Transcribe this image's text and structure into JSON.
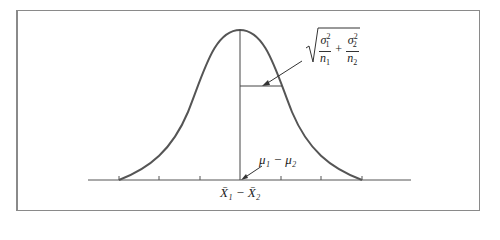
{
  "diagram": {
    "type": "normal-curve",
    "std_error_label": {
      "sqrt": "√",
      "term1_num": "σ",
      "term1_num_sup": "2",
      "term1_num_sub": "1",
      "term1_den": "n",
      "term1_den_sub": "1",
      "plus": "+",
      "term2_num": "σ",
      "term2_num_sup": "2",
      "term2_num_sub": "2",
      "term2_den": "n",
      "term2_den_sub": "2"
    },
    "mean_label": "μ₁ − μ₂",
    "axis_label": "X̄₁ − X̄₂",
    "tick_count": 7,
    "colors": {
      "curve": "#555555",
      "lines": "#444444",
      "frame": "#8a8a8a"
    }
  }
}
